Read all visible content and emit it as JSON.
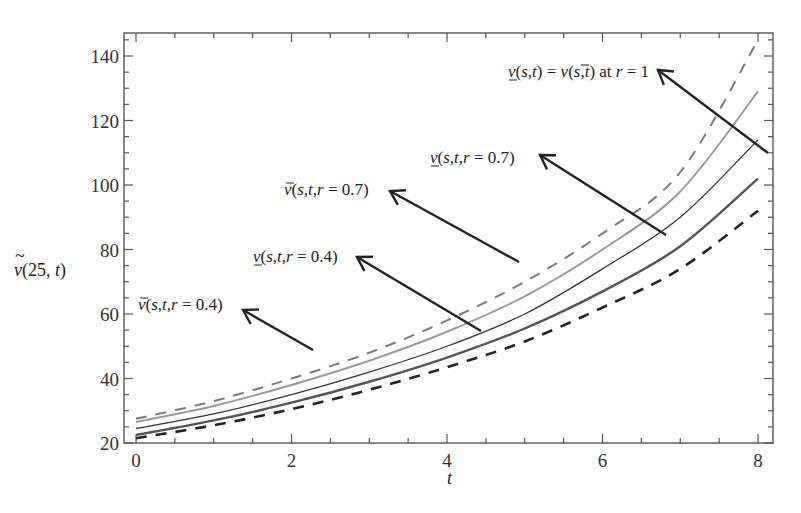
{
  "chart_data": {
    "type": "line",
    "title": "",
    "xlabel": "t",
    "ylabel": "ṽ(25, t)",
    "xlim": [
      -0.15,
      8.2
    ],
    "ylim": [
      20,
      147
    ],
    "x_ticks": [
      0,
      2,
      4,
      6,
      8
    ],
    "y_ticks": [
      20,
      40,
      60,
      80,
      100,
      120,
      140
    ],
    "grid": false,
    "legend": "annotations with arrows",
    "x": [
      0,
      1,
      2,
      3,
      4,
      5,
      6,
      7,
      8
    ],
    "series": [
      {
        "name": "v̄(s,t,r=0.4)",
        "style": "dashed",
        "color": "#7a7a7a",
        "width": 2,
        "values": [
          27.5,
          33,
          40,
          48,
          58,
          70,
          85,
          104,
          145
        ]
      },
      {
        "name": "v̄(s,t,r=0.7)",
        "style": "solid",
        "color": "#999999",
        "width": 2,
        "values": [
          26.5,
          31.5,
          38,
          45.5,
          54.5,
          65.5,
          80,
          98,
          129
        ]
      },
      {
        "name": "v(s,t) = v̄(s,t) at r=1",
        "style": "solid",
        "color": "#333333",
        "width": 1.3,
        "values": [
          24.5,
          29,
          35,
          42,
          50,
          60,
          74,
          90,
          114
        ]
      },
      {
        "name": "v(s,t,r=0.7)",
        "style": "solid",
        "color": "#555555",
        "width": 2.4,
        "values": [
          22.5,
          27,
          32.5,
          39,
          46.5,
          55.5,
          67,
          81,
          102
        ]
      },
      {
        "name": "v(s,t,r=0.4)",
        "style": "dashed",
        "color": "#222222",
        "width": 2.6,
        "values": [
          21.5,
          25.5,
          30.5,
          36.5,
          43.5,
          51.5,
          62,
          74,
          92
        ]
      }
    ],
    "annotations": [
      {
        "id": "ann1",
        "parts": [
          [
            "v",
            "under-it"
          ],
          [
            "(s,t) = ",
            "it"
          ],
          [
            "v",
            "bar-it"
          ],
          [
            "(s,t) at ",
            "it-mix"
          ],
          [
            "r",
            "it"
          ],
          [
            " = 1",
            "rm"
          ]
        ],
        "text": "v(s,t) = v̄(s,t) at r = 1",
        "label_x": 508,
        "label_y": 77,
        "arrow_from": [
          768,
          153
        ],
        "arrow_to": [
          658,
          70
        ]
      },
      {
        "id": "ann2",
        "text": "v(s,t,r = 0.7)",
        "underbar": "under",
        "label_x": 430,
        "label_y": 163,
        "arrow_from": [
          666,
          235
        ],
        "arrow_to": [
          540,
          155
        ]
      },
      {
        "id": "ann3",
        "text": "v̄(s,t,r = 0.7)",
        "underbar": "bar",
        "label_x": 284,
        "label_y": 195,
        "arrow_from": [
          519,
          262
        ],
        "arrow_to": [
          390,
          191
        ]
      },
      {
        "id": "ann4",
        "text": "v(s,t,r = 0.4)",
        "underbar": "under",
        "label_x": 253,
        "label_y": 262,
        "arrow_from": [
          481,
          331
        ],
        "arrow_to": [
          357,
          257
        ]
      },
      {
        "id": "ann5",
        "text": "v̄(s,t,r = 0.4)",
        "underbar": "bar",
        "label_x": 138,
        "label_y": 310,
        "arrow_from": [
          313,
          350
        ],
        "arrow_to": [
          243,
          310
        ]
      }
    ]
  },
  "axes": {
    "ylabel_text": "ṽ(25, t)",
    "xlabel_text": "t"
  }
}
